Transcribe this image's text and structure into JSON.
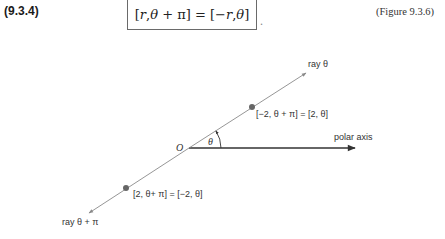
{
  "header": {
    "equation_number": "(9.3.4)",
    "equation": {
      "lhs_open": "[",
      "r": "r",
      "comma1": ", ",
      "theta": "θ",
      "plus_pi": " + π",
      "lhs_close": "]",
      "equals": " = ",
      "rhs_open": "[",
      "neg_r": "−r",
      "comma2": ",",
      "theta2": "θ",
      "rhs_close": "]"
    },
    "trailing_punctuation": ".",
    "figure_reference": "(Figure 9.3.6)"
  },
  "figure": {
    "origin_label": "O",
    "angle_label": "θ",
    "polar_axis_label": "polar axis",
    "ray_theta_label": "ray θ",
    "ray_theta_plus_pi_label": "ray θ + π",
    "upper_point_label": "[−2, θ + π] = [2,  θ]",
    "lower_point_label": "[2,  θ+ π] = [−2,  θ]",
    "colors": {
      "polar_axis": "#333333",
      "ray": "#8a8a8a",
      "point": "#666666",
      "text": "#333333"
    },
    "geometry": {
      "origin": [
        189,
        148
      ],
      "polar_axis_end": [
        356,
        148
      ],
      "ray_theta_end": [
        307,
        72
      ],
      "ray_theta_plus_pi_end": [
        88,
        214
      ],
      "upper_point": [
        252,
        107
      ],
      "lower_point": [
        126,
        188
      ],
      "angle_deg": 33
    }
  }
}
